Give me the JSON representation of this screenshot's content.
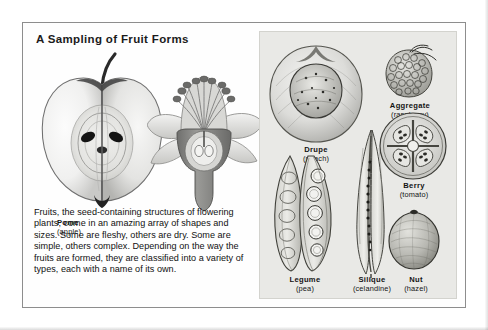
{
  "plate": {
    "title": "A Sampling of Fruit Forms",
    "body_text": "Fruits, the seed-containing structures of flowering plants, come in an amazing array of shapes and sizes. Some are fleshy, others are dry. Some are simple, others complex. Depending on the way the fruits are formed, they are classified into a variety of types, each with a name of its own."
  },
  "left_figures": [
    {
      "id": "apple-figure",
      "icon": "apple-cross-section-illustration",
      "label_name": "Pome",
      "label_sub": "(apple)"
    },
    {
      "id": "flower-figure",
      "icon": "flower-cross-section-illustration",
      "label_name": "",
      "label_sub": ""
    }
  ],
  "right_panel": {
    "figures": [
      {
        "id": "fig-drupe",
        "icon": "peach-drupe-illustration",
        "name": "Drupe",
        "sub": "(peach)"
      },
      {
        "id": "fig-aggr",
        "icon": "raspberry-aggregate-illustration",
        "name": "Aggregate",
        "sub": "(raspberry)"
      },
      {
        "id": "fig-berry",
        "icon": "tomato-berry-illustration",
        "name": "Berry",
        "sub": "(tomato)"
      },
      {
        "id": "fig-legume",
        "icon": "pea-legume-illustration",
        "name": "Legume",
        "sub": "(pea)"
      },
      {
        "id": "fig-silique",
        "icon": "celandine-silique-illustration",
        "name": "Silique",
        "sub": "(celandine)"
      },
      {
        "id": "fig-nut",
        "icon": "hazel-nut-illustration",
        "name": "Nut",
        "sub": "(hazel)"
      }
    ]
  },
  "colors": {
    "page_background": "#ffffff",
    "plate_background": "#fefefe",
    "plate_border": "#8d8d8d",
    "panel_background": "#e9e9e6",
    "panel_border": "#d3d3ce",
    "text": "#111111"
  }
}
